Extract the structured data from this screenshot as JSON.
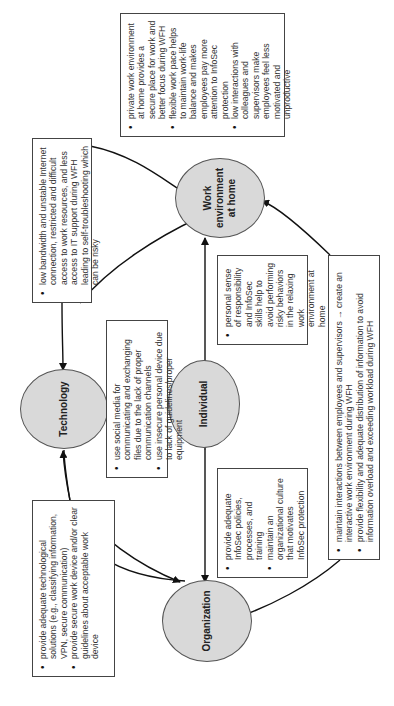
{
  "nodes": {
    "technology": "Technology",
    "work_env": "Work environment at home",
    "individual": "Individual",
    "organization": "Organization"
  },
  "boxes": {
    "tech_issues": {
      "items": [
        "low bandwidth and unstable Internet connection, restricted and difficult access to work resources, and less access to IT support during WFH leading to self-troubleshooting which can be risky"
      ]
    },
    "wfh_environment": {
      "items": [
        "private work environment at home provides a secure place for work and better focus during WFH",
        "flexible work pace helps to maintain work-life balance and makes employees pay more attention to InfoSec protection",
        "low interactions with colleagues and supervisors make employees feel less motivated and unproductive"
      ]
    },
    "individual_tech": {
      "items": [
        "use social media for communicating and exchanging files due to the lack of proper communication channels",
        "use insecure personal device due to lack of guidelines/proper equipment"
      ]
    },
    "personal_responsibility": {
      "items": [
        "personal sense of responsibility and InfoSec skills help to avoid performing risky behaviors in the relaxing work environment at home"
      ]
    },
    "tech_solutions": {
      "items": [
        "provide adequate technological solutions (e.g., classifying information, VPN, secure communication)",
        "provide secure work device and/or clear guidelines about acceptable work device"
      ]
    },
    "infosec_policies": {
      "items": [
        "provide adequate InfoSec policies, processes, and training",
        "maintain an organizational culture that motivates InfoSec protection"
      ]
    },
    "interactions": {
      "items": [
        "maintain interactions between employees and supervisors → create an interactive work environment during WFH",
        "provide flexibility and adequate distribution of information to avoid information overload and exceeding workload during WFH"
      ]
    }
  },
  "colors": {
    "node_fill": "#d9d9d9",
    "line": "#111111",
    "box_border": "#444444"
  }
}
